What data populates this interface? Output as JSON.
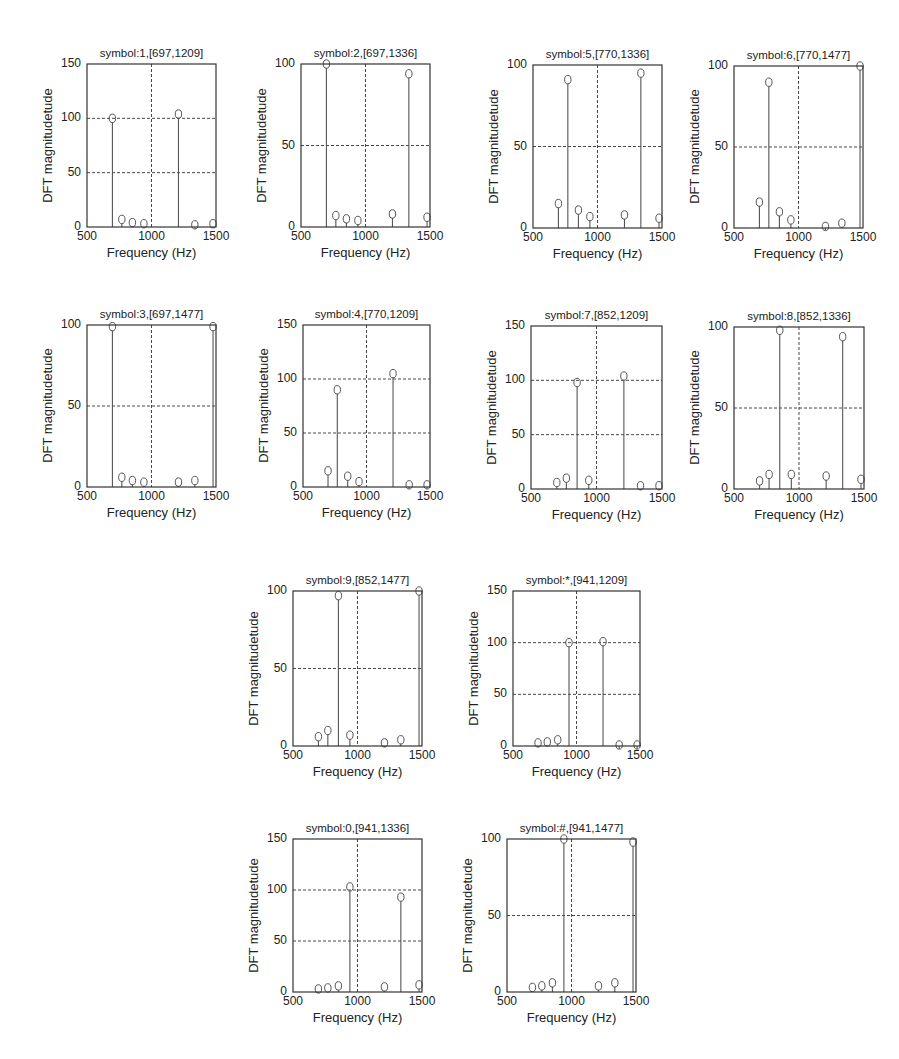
{
  "figure": {
    "header_fragment": "...ppe... ...g..."
  },
  "chart_data": [
    {
      "type": "stem",
      "id": "p1",
      "title": "symbol:1,[697,1209]",
      "xlabel": "Frequency (Hz)",
      "ylabel": "DFT magnitudetude",
      "xlim": [
        500,
        1500
      ],
      "ylim": [
        0,
        150
      ],
      "xticks": [
        500,
        1000,
        1500
      ],
      "yticks": [
        0,
        50,
        100,
        150
      ],
      "grid": true,
      "x": [
        697,
        770,
        852,
        941,
        1209,
        1336,
        1477
      ],
      "values": [
        100,
        7,
        4,
        3,
        104,
        2,
        3
      ],
      "box": [
        87,
        64,
        216,
        227
      ]
    },
    {
      "type": "stem",
      "id": "p2",
      "title": "symbol:2,[697,1336]",
      "xlabel": "Frequency (Hz)",
      "ylabel": "DFT magnitudetude",
      "xlim": [
        500,
        1500
      ],
      "ylim": [
        0,
        100
      ],
      "xticks": [
        500,
        1000,
        1500
      ],
      "yticks": [
        0,
        50,
        100
      ],
      "grid": true,
      "x": [
        697,
        770,
        852,
        941,
        1209,
        1336,
        1477
      ],
      "values": [
        100,
        7,
        5,
        4,
        8,
        94,
        6
      ],
      "box": [
        301,
        64,
        430,
        227
      ]
    },
    {
      "type": "stem",
      "id": "p5",
      "title": "symbol:5,[770,1336]",
      "xlabel": "Frequency (Hz)",
      "ylabel": "DFT magnitudetude",
      "xlim": [
        500,
        1500
      ],
      "ylim": [
        0,
        100
      ],
      "xticks": [
        500,
        1000,
        1500
      ],
      "yticks": [
        0,
        50,
        100
      ],
      "grid": true,
      "x": [
        697,
        770,
        852,
        941,
        1209,
        1336,
        1477
      ],
      "values": [
        15,
        91,
        11,
        7,
        8,
        95,
        6
      ],
      "box": [
        533,
        65,
        662,
        228
      ]
    },
    {
      "type": "stem",
      "id": "p6",
      "title": "symbol:6,[770,1477]",
      "xlabel": "Frequency (Hz)",
      "ylabel": "DFT magnitudetude",
      "xlim": [
        500,
        1500
      ],
      "ylim": [
        0,
        100
      ],
      "xticks": [
        500,
        1000,
        1500
      ],
      "yticks": [
        0,
        50,
        100
      ],
      "grid": true,
      "x": [
        697,
        770,
        852,
        941,
        1209,
        1336,
        1477
      ],
      "values": [
        16,
        90,
        10,
        5,
        1,
        3,
        100
      ],
      "box": [
        734,
        66,
        863,
        228
      ]
    },
    {
      "type": "stem",
      "id": "p3",
      "title": "symbol:3,[697,1477]",
      "xlabel": "Frequency (Hz)",
      "ylabel": "DFT magnitudetude",
      "xlim": [
        500,
        1500
      ],
      "ylim": [
        0,
        100
      ],
      "xticks": [
        500,
        1000,
        1500
      ],
      "yticks": [
        0,
        50,
        100
      ],
      "grid": true,
      "x": [
        697,
        770,
        852,
        941,
        1209,
        1336,
        1477
      ],
      "values": [
        99,
        6,
        4,
        3,
        3,
        4,
        99
      ],
      "box": [
        87,
        325,
        216,
        487
      ]
    },
    {
      "type": "stem",
      "id": "p4",
      "title": "symbol:4,[770,1209]",
      "xlabel": "Frequency (Hz)",
      "ylabel": "DFT magnitudetude",
      "xlim": [
        500,
        1500
      ],
      "ylim": [
        0,
        150
      ],
      "xticks": [
        500,
        1000,
        1500
      ],
      "yticks": [
        0,
        50,
        100,
        150
      ],
      "grid": true,
      "x": [
        697,
        770,
        852,
        941,
        1209,
        1336,
        1477
      ],
      "values": [
        15,
        90,
        10,
        5,
        105,
        2,
        2
      ],
      "box": [
        303,
        325,
        430,
        487
      ]
    },
    {
      "type": "stem",
      "id": "p7",
      "title": "symbol:7,[852,1209]",
      "xlabel": "Frequency (Hz)",
      "ylabel": "DFT magnitudetude",
      "xlim": [
        500,
        1500
      ],
      "ylim": [
        0,
        150
      ],
      "xticks": [
        500,
        1000,
        1500
      ],
      "yticks": [
        0,
        50,
        100,
        150
      ],
      "grid": true,
      "x": [
        697,
        770,
        852,
        941,
        1209,
        1336,
        1477
      ],
      "values": [
        6,
        10,
        98,
        8,
        104,
        3,
        3
      ],
      "box": [
        531,
        326,
        662,
        489
      ]
    },
    {
      "type": "stem",
      "id": "p8",
      "title": "symbol:8,[852,1336]",
      "xlabel": "Frequency (Hz)",
      "ylabel": "DFT magnitudetude",
      "xlim": [
        500,
        1500
      ],
      "ylim": [
        0,
        100
      ],
      "xticks": [
        500,
        1000,
        1500
      ],
      "yticks": [
        0,
        50,
        100
      ],
      "grid": true,
      "x": [
        697,
        770,
        852,
        941,
        1209,
        1336,
        1477
      ],
      "values": [
        5,
        9,
        98,
        9,
        8,
        94,
        6
      ],
      "box": [
        734,
        327,
        864,
        489
      ]
    },
    {
      "type": "stem",
      "id": "p9",
      "title": "symbol:9,[852,1477]",
      "xlabel": "Frequency (Hz)",
      "ylabel": "DFT magnitudetude",
      "xlim": [
        500,
        1500
      ],
      "ylim": [
        0,
        100
      ],
      "xticks": [
        500,
        1000,
        1500
      ],
      "yticks": [
        0,
        50,
        100
      ],
      "grid": true,
      "x": [
        697,
        770,
        852,
        941,
        1209,
        1336,
        1477
      ],
      "values": [
        6,
        10,
        97,
        7,
        2,
        4,
        100
      ],
      "box": [
        293,
        591,
        422,
        746
      ]
    },
    {
      "type": "stem",
      "id": "pstar",
      "title": "symbol:*,[941,1209]",
      "xlabel": "Frequency (Hz)",
      "ylabel": "DFT magnitudetude",
      "xlim": [
        500,
        1500
      ],
      "ylim": [
        0,
        150
      ],
      "xticks": [
        500,
        1000,
        1500
      ],
      "yticks": [
        0,
        50,
        100,
        150
      ],
      "grid": true,
      "x": [
        697,
        770,
        852,
        941,
        1209,
        1336,
        1477
      ],
      "values": [
        3,
        4,
        6,
        100,
        101,
        1,
        1
      ],
      "box": [
        513,
        591,
        640,
        746
      ]
    },
    {
      "type": "stem",
      "id": "p0",
      "title": "symbol:0,[941,1336]",
      "xlabel": "Frequency (Hz)",
      "ylabel": "DFT magnitudetude",
      "xlim": [
        500,
        1500
      ],
      "ylim": [
        0,
        150
      ],
      "xticks": [
        500,
        1000,
        1500
      ],
      "yticks": [
        0,
        50,
        100,
        150
      ],
      "grid": true,
      "x": [
        697,
        770,
        852,
        941,
        1209,
        1336,
        1477
      ],
      "values": [
        3,
        4,
        6,
        103,
        5,
        93,
        7
      ],
      "box": [
        293,
        839,
        422,
        992
      ]
    },
    {
      "type": "stem",
      "id": "phash",
      "title": "symbol:#,[941,1477]",
      "xlabel": "Frequency (Hz)",
      "ylabel": "DFT magnitudetude",
      "xlim": [
        500,
        1500
      ],
      "ylim": [
        0,
        100
      ],
      "xticks": [
        500,
        1000,
        1500
      ],
      "yticks": [
        0,
        50,
        100
      ],
      "grid": true,
      "x": [
        697,
        770,
        852,
        941,
        1209,
        1336,
        1477
      ],
      "values": [
        3,
        4,
        6,
        100,
        4,
        6,
        98
      ],
      "box": [
        507,
        839,
        636,
        992
      ]
    }
  ],
  "style": {
    "line_color": "#555555",
    "grid_color": "#333333",
    "axis_color": "#333333",
    "text_color": "#222222"
  }
}
